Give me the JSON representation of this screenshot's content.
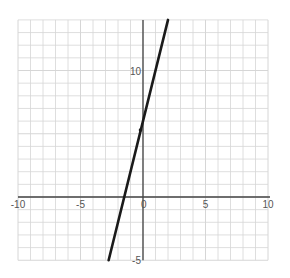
{
  "chart_data": {
    "type": "line",
    "title": "",
    "xlabel": "",
    "ylabel": "",
    "xlim": [
      -10,
      10
    ],
    "ylim": [
      -5,
      14
    ],
    "grid": true,
    "grid_step": 1,
    "x_tick_labels": [
      {
        "value": -10,
        "label": "-10"
      },
      {
        "value": -5,
        "label": "-5"
      },
      {
        "value": 0,
        "label": "0"
      },
      {
        "value": 5,
        "label": "5"
      },
      {
        "value": 10,
        "label": "10"
      }
    ],
    "y_tick_labels": [
      {
        "value": 10,
        "label": "10"
      },
      {
        "value": -5,
        "label": "-5"
      }
    ],
    "series": [
      {
        "name": "line",
        "equation": "y = 4x + 6",
        "points": [
          [
            -2.75,
            -5
          ],
          [
            2,
            14
          ]
        ],
        "x_intercept": -1.5,
        "y_intercept": 6,
        "color": "#1a1a1a"
      }
    ],
    "marked_points": [
      {
        "x": -0.2,
        "y": 5.3
      }
    ],
    "legend": []
  },
  "colors": {
    "grid": "#d6d6d6",
    "axis": "#444444",
    "line": "#1a1a1a",
    "label": "#555555"
  }
}
